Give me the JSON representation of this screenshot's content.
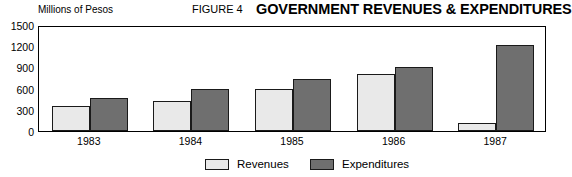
{
  "header": {
    "figure_number": "FIGURE 4",
    "title": "GOVERNMENT REVENUES & EXPENDITURES",
    "unit_label": "Millions of Pesos"
  },
  "legend": {
    "entries": [
      {
        "label": "Revenues",
        "color": "#e9e9e9",
        "swatch_name": "legend-swatch-revenues"
      },
      {
        "label": "Expenditures",
        "color": "#6f6f6f",
        "swatch_name": "legend-swatch-expenditures"
      }
    ]
  },
  "chart_data": {
    "type": "bar",
    "title": "GOVERNMENT REVENUES & EXPENDITURES",
    "subtitle": "FIGURE 4",
    "xlabel": "",
    "ylabel": "Millions of Pesos",
    "categories": [
      "1983",
      "1984",
      "1985",
      "1986",
      "1987"
    ],
    "series": [
      {
        "name": "Revenues",
        "color": "#e9e9e9",
        "values": [
          350,
          420,
          590,
          800,
          110
        ]
      },
      {
        "name": "Expenditures",
        "color": "#6f6f6f",
        "values": [
          470,
          590,
          730,
          900,
          1220
        ]
      }
    ],
    "ylim": [
      0,
      1500
    ],
    "yticks": [
      0,
      300,
      600,
      900,
      1200,
      1500
    ],
    "ytick_labels": [
      "0",
      "300",
      "600",
      "900",
      "1200",
      "1500"
    ],
    "grid": false,
    "legend_position": "bottom-center",
    "bar_border_color": "#1a1a1a",
    "plot_border_color": "#000000"
  }
}
